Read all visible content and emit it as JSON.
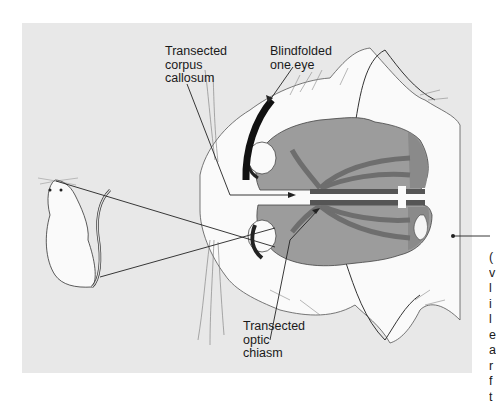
{
  "figure": {
    "labels": {
      "corpus_callosum": "Transected\ncorpus\ncallosum",
      "blindfold": "Blindfolded\none eye",
      "optic_chiasm": "Transected\noptic\nchiasm"
    },
    "clipped_caption": "(\nv\nl\ni\nl\ne\na\nr\nf\nt",
    "colors": {
      "panel_background": "#e8e8e8",
      "brain_fill": "#9c9c9c",
      "brain_dark_region": "#8a8a8a",
      "optic_tract": "#7a7a7a",
      "corpus_callosum_band": "#555555",
      "cat_fur": "#fafafa",
      "blindfold": "#111111",
      "lines": "#222222"
    }
  }
}
